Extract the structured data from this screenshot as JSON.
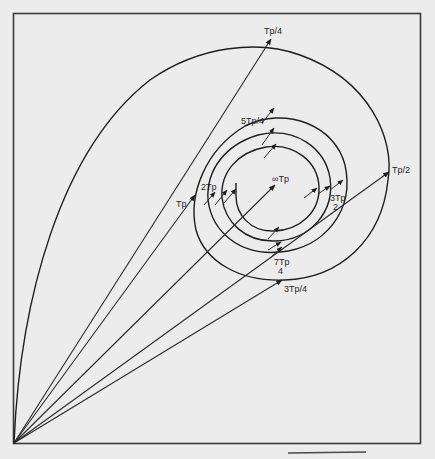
{
  "diagram": {
    "type": "spiral-trajectory-with-position-vectors",
    "origin": {
      "x": 14,
      "y": 443
    },
    "labels": {
      "tp4": "Tp/4",
      "tp2": "Tp/2",
      "tp34": "3Tp/4",
      "tp": "Tp",
      "tp54": "5Tp/4",
      "tp32_num": "3Tp",
      "tp32_den": "2",
      "tp74_num": "7Tp",
      "tp74_den": "4",
      "tp2x": "2Tp",
      "infinity": "∞Tp"
    },
    "colors": {
      "background": "#ececec",
      "ink": "#1e1e1e",
      "frame": "#3a3a3a"
    }
  }
}
